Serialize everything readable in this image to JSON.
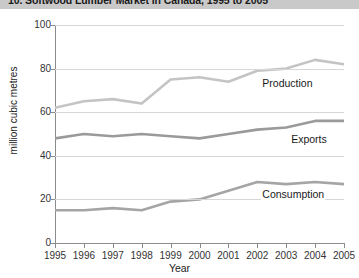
{
  "title": "10. Softwood Lumber Market in Canada, 1995 to 2005",
  "chart_data": {
    "type": "line",
    "title": "10. Softwood Lumber Market in Canada, 1995 to 2005",
    "xlabel": "Year",
    "ylabel": "million cubic metres",
    "categories": [
      "1995",
      "1996",
      "1997",
      "1998",
      "1999",
      "2000",
      "2001",
      "2002",
      "2003",
      "2004",
      "2005"
    ],
    "x": [
      1995,
      1996,
      1997,
      1998,
      1999,
      2000,
      2001,
      2002,
      2003,
      2004,
      2005
    ],
    "xlim": [
      1995,
      2005
    ],
    "ylim": [
      0,
      100
    ],
    "yticks": [
      0,
      20,
      40,
      60,
      80,
      100
    ],
    "grid": true,
    "legend_position": "inline-right",
    "series": [
      {
        "name": "Production",
        "color": "#c4c4c4",
        "values": [
          62,
          65,
          66,
          64,
          75,
          76,
          74,
          79,
          80,
          84,
          82
        ]
      },
      {
        "name": "Exports",
        "color": "#9a9a9a",
        "values": [
          48,
          50,
          49,
          50,
          49,
          48,
          50,
          52,
          53,
          56,
          56
        ]
      },
      {
        "name": "Consumption",
        "color": "#a5a5a5",
        "values": [
          15,
          15,
          16,
          15,
          19,
          20,
          24,
          28,
          27,
          28,
          27
        ]
      }
    ]
  },
  "series_labels": {
    "production": "Production",
    "exports": "Exports",
    "consumption": "Consumption"
  },
  "axis": {
    "y_title": "million cubic metres",
    "x_title": "Year",
    "y_ticks": [
      "0",
      "20",
      "40",
      "60",
      "80",
      "100"
    ],
    "x_ticks": [
      "1995",
      "1996",
      "1997",
      "1998",
      "1999",
      "2000",
      "2001",
      "2002",
      "2003",
      "2004",
      "2005"
    ]
  }
}
